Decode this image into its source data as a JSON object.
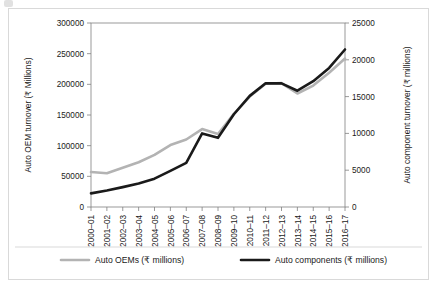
{
  "figure": {
    "background_color": "#ffffff",
    "border_color": "#d9d9d9"
  },
  "chart_data": {
    "type": "line",
    "title": "",
    "xlabel": "",
    "ylabel": "Auto OEM turnover (₹ Millions)",
    "y2label": "Auto component turnover (₹ millions)",
    "grid": false,
    "legend_position": "bottom",
    "categories": [
      "2000–01",
      "2001–02",
      "2002–03",
      "2003–04",
      "2004–05",
      "2005–06",
      "2006–07",
      "2007–08",
      "2008–09",
      "2009–10",
      "2010–11",
      "2011–12",
      "2012–13",
      "2013–14",
      "2014–15",
      "2015–16",
      "2016–17"
    ],
    "ylim": [
      0,
      300000
    ],
    "yticks": [
      0,
      50000,
      100000,
      150000,
      200000,
      250000,
      300000
    ],
    "ytick_labels": [
      "0",
      "50000",
      "100000",
      "150000",
      "200000",
      "250000",
      "300000"
    ],
    "y2lim": [
      0,
      25000
    ],
    "y2ticks": [
      0,
      5000,
      10000,
      15000,
      20000,
      25000
    ],
    "y2tick_labels": [
      "0",
      "5000",
      "10000",
      "15000",
      "20000",
      "25000"
    ],
    "series": [
      {
        "name": "Auto OEMs (₹ millions)",
        "axis": "left",
        "color": "#b3b3b3",
        "width": 2.6,
        "values": [
          57000,
          55000,
          64000,
          73000,
          85000,
          101000,
          110000,
          127000,
          119000,
          152000,
          180000,
          201000,
          202000,
          185000,
          198000,
          219000,
          242000
        ]
      },
      {
        "name": "Auto components (₹ millions)",
        "axis": "right",
        "color": "#1a1a1a",
        "width": 2.6,
        "values": [
          1850,
          2250,
          2700,
          3200,
          3850,
          4900,
          6000,
          10000,
          9400,
          12600,
          15100,
          16800,
          16800,
          15800,
          17100,
          18900,
          21400
        ]
      }
    ]
  },
  "legend": {
    "items": [
      {
        "label": "Auto OEMs (₹ millions)",
        "color": "#b3b3b3"
      },
      {
        "label": "Auto components (₹ millions)",
        "color": "#1a1a1a"
      }
    ]
  }
}
